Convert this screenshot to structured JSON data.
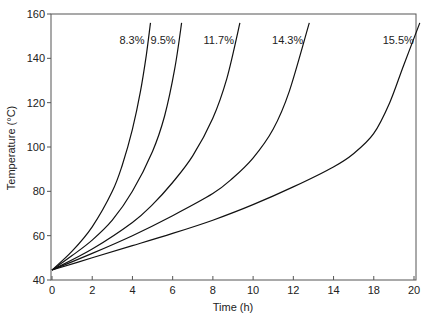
{
  "chart_data": {
    "type": "line",
    "title": "",
    "xlabel": "Time (h)",
    "ylabel": "Temperature (°C)",
    "xlim": [
      0,
      20
    ],
    "ylim": [
      40,
      160
    ],
    "x_tick_labels": [
      "0",
      "2",
      "4",
      "6",
      "8",
      "10",
      "12",
      "14",
      "18",
      "20"
    ],
    "y_tick_labels": [
      "40",
      "60",
      "80",
      "100",
      "120",
      "140",
      "160"
    ],
    "grid": false,
    "legend": "inline labels at top of each curve",
    "series": [
      {
        "name": "8.3%",
        "x": [
          0,
          1,
          2,
          3,
          3.5,
          4,
          4.4,
          4.7,
          4.9
        ],
        "y": [
          44.5,
          53,
          64,
          80,
          92,
          108,
          125,
          142,
          156
        ]
      },
      {
        "name": "9.5%",
        "x": [
          0,
          1,
          2,
          3,
          4,
          5,
          5.6,
          6.1,
          6.45
        ],
        "y": [
          44.5,
          51,
          58,
          67,
          80,
          98,
          114,
          135,
          156
        ]
      },
      {
        "name": "11.7%",
        "x": [
          0,
          2,
          4,
          5,
          6,
          7,
          8,
          8.7,
          9.35
        ],
        "y": [
          44.5,
          54,
          66,
          74,
          84,
          96,
          113,
          131,
          156
        ]
      },
      {
        "name": "14.3%",
        "x": [
          0,
          2,
          4,
          6,
          8,
          9,
          10,
          11,
          11.8,
          12.8
        ],
        "y": [
          44.5,
          52,
          60,
          69,
          79,
          86,
          95,
          108,
          125,
          156
        ]
      },
      {
        "name": "15.5%",
        "x": [
          0,
          2,
          4,
          6,
          8,
          10,
          12,
          14,
          15,
          16,
          16.8,
          17.5,
          18.3
        ],
        "y": [
          44.5,
          50,
          55.5,
          61,
          67,
          74,
          82,
          91,
          97,
          106,
          120,
          137,
          156
        ]
      }
    ]
  }
}
